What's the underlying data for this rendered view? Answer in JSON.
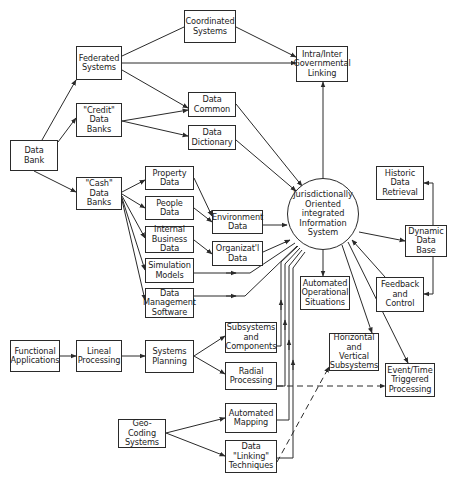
{
  "diagram": {
    "center": {
      "label": "Jurisdictionally\nOriented\nintegrated\nInformation\nSystem"
    },
    "nodes": {
      "data_bank": "Data\nBank",
      "federated": "Federated\nSystems",
      "credit": "\"Credit\"\nData\nBanks",
      "cash": "\"Cash\"\nData\nBanks",
      "coordinated": "Coordinated\nSystems",
      "intra_inter": "Intra/Inter\nGovernmental\nLinking",
      "data_common": "Data\nCommon",
      "data_dictionary": "Data\nDictionary",
      "property": "Property\nData",
      "people": "People\nData",
      "internal_business": "Internal\nBusiness\nData",
      "simulation": "Simulation\nModels",
      "data_management": "Data\nManagement\nSoftware",
      "environment": "Environment\nData",
      "organizational": "Organizat'l\nData",
      "historic": "Historic\nData\nRetrieval",
      "dynamic_db": "Dynamic\nData\nBase",
      "feedback": "Feedback\nand\nControl",
      "automated_operational": "Automated\nOperational\nSituations",
      "functional": "Functional\nApplications",
      "lineal": "Lineal\nProcessing",
      "systems_planning": "Systems\nPlanning",
      "subsystems": "Subsystems\nand\nComponents",
      "radial": "Radial\nProcessing",
      "horizontal_vertical": "Horizontal\nand\nVertical\nSubsystems",
      "event_time": "Event/Time\nTriggered\nProcessing",
      "geo_coding": "Geo-Coding\nSystems",
      "automated_mapping": "Automated\nMapping",
      "data_linking": "Data\n\"Linking\"\nTechniques"
    },
    "edges": [
      [
        "data_bank",
        "federated"
      ],
      [
        "data_bank",
        "credit"
      ],
      [
        "data_bank",
        "cash"
      ],
      [
        "federated",
        "coordinated"
      ],
      [
        "federated",
        "intra_inter"
      ],
      [
        "federated",
        "data_common"
      ],
      [
        "coordinated",
        "intra_inter"
      ],
      [
        "credit",
        "data_common"
      ],
      [
        "credit",
        "data_dictionary"
      ],
      [
        "data_common",
        "center"
      ],
      [
        "data_dictionary",
        "center"
      ],
      [
        "cash",
        "property"
      ],
      [
        "cash",
        "people"
      ],
      [
        "cash",
        "internal_business"
      ],
      [
        "cash",
        "simulation"
      ],
      [
        "cash",
        "data_management"
      ],
      [
        "property",
        "environment"
      ],
      [
        "people",
        "environment"
      ],
      [
        "internal_business",
        "organizational"
      ],
      [
        "environment",
        "center"
      ],
      [
        "organizational",
        "center"
      ],
      [
        "simulation",
        "center"
      ],
      [
        "data_management",
        "center"
      ],
      [
        "center",
        "intra_inter"
      ],
      [
        "center",
        "dynamic_db"
      ],
      [
        "center",
        "automated_operational"
      ],
      [
        "center",
        "horizontal_vertical"
      ],
      [
        "center",
        "event_time"
      ],
      [
        "dynamic_db",
        "historic"
      ],
      [
        "dynamic_db",
        "feedback"
      ],
      [
        "feedback",
        "center"
      ],
      [
        "functional",
        "lineal"
      ],
      [
        "lineal",
        "systems_planning"
      ],
      [
        "systems_planning",
        "subsystems"
      ],
      [
        "systems_planning",
        "radial"
      ],
      [
        "subsystems",
        "center"
      ],
      [
        "radial",
        "center"
      ],
      [
        "automated_mapping",
        "center"
      ],
      [
        "data_linking",
        "center"
      ],
      [
        "geo_coding",
        "automated_mapping"
      ],
      [
        "geo_coding",
        "data_linking"
      ],
      [
        "radial",
        "event_time",
        "dashed"
      ],
      [
        "data_linking",
        "horizontal_vertical",
        "dashed"
      ]
    ],
    "colors": {
      "ink": "#2a2a2a",
      "background": "#ffffff"
    }
  }
}
